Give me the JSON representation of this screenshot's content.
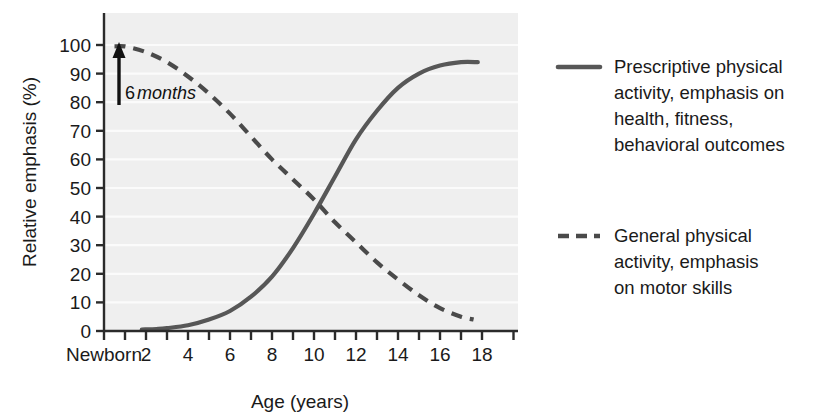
{
  "chart_data": {
    "type": "line",
    "title": "",
    "xlabel": "Age (years)",
    "ylabel": "Relative emphasis (%)",
    "xlim": [
      0,
      19.5
    ],
    "ylim": [
      0,
      105
    ],
    "grid": "horizontal",
    "plot_background": "#efefef",
    "gridline_color": "#fbfbfb",
    "axis_color": "#2b2b2b",
    "xticks": [
      0,
      1,
      2,
      3,
      4,
      5,
      6,
      7,
      8,
      9,
      10,
      11,
      12,
      13,
      14,
      15,
      16,
      17,
      18,
      19.5
    ],
    "xtick_labels": [
      "Newborn",
      "",
      "2",
      "",
      "4",
      "",
      "6",
      "",
      "8",
      "",
      "10",
      "",
      "12",
      "",
      "14",
      "",
      "16",
      "",
      "18",
      ""
    ],
    "yticks": [
      0,
      10,
      20,
      30,
      40,
      50,
      60,
      70,
      80,
      90,
      100
    ],
    "ytick_labels": [
      "0",
      "10",
      "20",
      "30",
      "40",
      "50",
      "60",
      "70",
      "80",
      "90",
      "100"
    ],
    "annotations": [
      {
        "name": "six-months-arrow",
        "text_number": "6",
        "text_emphasis": "months",
        "x_age": 0.95,
        "y_from": 30,
        "y_to": 97,
        "marker": "up-arrow"
      }
    ],
    "series": [
      {
        "name": "Prescriptive physical activity, emphasis on health, fitness, behavioral outcomes",
        "style": "solid",
        "color": "#575757",
        "x": [
          1.8,
          2.5,
          3,
          4,
          5,
          6,
          7,
          8,
          9,
          10,
          11,
          12,
          13,
          14,
          15,
          16,
          17,
          17.8
        ],
        "y": [
          0.5,
          0.7,
          1,
          2,
          4,
          7,
          12,
          19,
          29,
          41,
          54,
          67,
          77,
          85,
          90,
          92.8,
          94,
          94
        ]
      },
      {
        "name": "General physical activity, emphasis on motor skills",
        "style": "dashed",
        "color": "#4a4a4a",
        "x": [
          0.5,
          1,
          2,
          3,
          4,
          5,
          6,
          7,
          8,
          9,
          10,
          11,
          12,
          13,
          14,
          15,
          16,
          17,
          17.6
        ],
        "y": [
          99.5,
          99.5,
          97.5,
          94,
          89,
          83,
          76,
          68,
          60,
          53,
          46,
          38,
          31,
          24,
          18,
          12.5,
          8,
          5,
          4
        ]
      }
    ],
    "crossing_point": {
      "x_age": 10.5,
      "y": 47
    }
  },
  "legend": {
    "position": "right",
    "entries": [
      {
        "swatch": "solid-line-swatch",
        "style": "solid",
        "color": "#575757",
        "lines": [
          "Prescriptive physical",
          "activity, emphasis on",
          "health, fitness,",
          "behavioral outcomes"
        ]
      },
      {
        "swatch": "dashed-line-swatch",
        "style": "dashed",
        "color": "#4a4a4a",
        "lines": [
          "General physical",
          "activity, emphasis",
          "on motor skills"
        ]
      }
    ]
  }
}
